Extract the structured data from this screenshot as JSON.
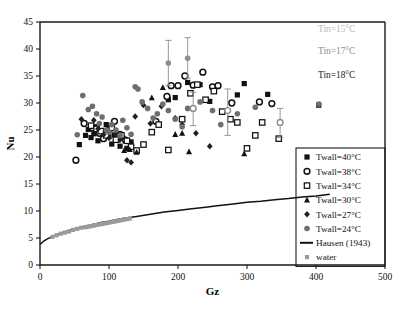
{
  "chart_data": {
    "type": "scatter",
    "title": "",
    "xlabel": "Gz",
    "ylabel": "Nu",
    "xlim": [
      0,
      500
    ],
    "ylim": [
      0,
      45
    ],
    "xticks": [
      0,
      100,
      200,
      300,
      400,
      500
    ],
    "yticks": [
      0,
      5,
      10,
      15,
      20,
      25,
      30,
      35,
      40,
      45
    ],
    "grid": false,
    "legend_position": "right-inside-box",
    "annotations": [
      {
        "name": "tin-15",
        "text": "Tin=15°C",
        "color": "#b9b9b9",
        "x": 430,
        "y": 43.2
      },
      {
        "name": "tin-17",
        "text": "Tin=17°C",
        "color": "#8d8d8d",
        "x": 430,
        "y": 39.0
      },
      {
        "name": "tin-18",
        "text": "Tin=18°C",
        "color": "#1a1a1a",
        "x": 430,
        "y": 34.6
      }
    ],
    "series": [
      {
        "name": "Twall=40°C",
        "label": "Twall=40°C",
        "marker": "filled-square",
        "color": "#111111",
        "points": [
          [
            57,
            22.3
          ],
          [
            66,
            24.0
          ],
          [
            70,
            25.1
          ],
          [
            74,
            23.6
          ],
          [
            78,
            24.3
          ],
          [
            80,
            25.6
          ],
          [
            84,
            23.0
          ],
          [
            88,
            24.6
          ],
          [
            96,
            26.0
          ],
          [
            100,
            23.8
          ],
          [
            104,
            22.4
          ],
          [
            108,
            24.1
          ],
          [
            112,
            23.2
          ],
          [
            116,
            22.0
          ],
          [
            120,
            23.5
          ],
          [
            126,
            21.6
          ],
          [
            132,
            22.8
          ],
          [
            186,
            30.6
          ],
          [
            196,
            31.0
          ],
          [
            214,
            33.8
          ],
          [
            232,
            33.4
          ],
          [
            246,
            30.3
          ],
          [
            286,
            31.5
          ],
          [
            296,
            33.6
          ],
          [
            330,
            31.6
          ],
          [
            404,
            29.6
          ]
        ]
      },
      {
        "name": "Twall=38°C",
        "label": "Twall=38°C",
        "marker": "open-circle-bold",
        "color": "#111111",
        "points": [
          [
            52,
            19.4
          ],
          [
            64,
            26.2
          ],
          [
            76,
            25.4
          ],
          [
            86,
            24.4
          ],
          [
            92,
            23.4
          ],
          [
            100,
            25.0
          ],
          [
            108,
            26.6
          ],
          [
            116,
            24.2
          ],
          [
            124,
            23.1
          ],
          [
            168,
            26.6
          ],
          [
            184,
            31.2
          ],
          [
            190,
            33.2
          ],
          [
            200,
            33.2
          ],
          [
            210,
            35.0
          ],
          [
            222,
            33.3
          ],
          [
            236,
            35.7
          ],
          [
            250,
            33.0
          ],
          [
            258,
            33.2
          ],
          [
            278,
            30.0
          ],
          [
            318,
            30.2
          ],
          [
            336,
            29.9
          ]
        ]
      },
      {
        "name": "Twall=34°C",
        "label": "Twall=34°C",
        "marker": "open-square",
        "color": "#111111",
        "points": [
          [
            74,
            25.8
          ],
          [
            82,
            25.2
          ],
          [
            88,
            24.8
          ],
          [
            96,
            24.0
          ],
          [
            104,
            25.4
          ],
          [
            110,
            23.2
          ],
          [
            118,
            24.0
          ],
          [
            126,
            23.0
          ],
          [
            132,
            21.9
          ],
          [
            140,
            21.2
          ],
          [
            150,
            22.3
          ],
          [
            162,
            24.6
          ],
          [
            172,
            26.0
          ],
          [
            186,
            21.3
          ],
          [
            206,
            27.0
          ],
          [
            218,
            31.8
          ],
          [
            228,
            33.4
          ],
          [
            240,
            30.6
          ],
          [
            252,
            32.2
          ],
          [
            264,
            28.4
          ],
          [
            276,
            27.0
          ],
          [
            286,
            26.4
          ],
          [
            300,
            21.6
          ],
          [
            312,
            24.0
          ],
          [
            322,
            26.4
          ],
          [
            346,
            23.4
          ]
        ]
      },
      {
        "name": "Twall=30°C",
        "label": "Twall=30°C",
        "marker": "filled-triangle",
        "color": "#111111",
        "points": [
          [
            122,
            21.2
          ],
          [
            130,
            21.4
          ],
          [
            140,
            20.9
          ],
          [
            162,
            31.0
          ],
          [
            178,
            32.9
          ],
          [
            196,
            24.2
          ],
          [
            206,
            24.4
          ],
          [
            216,
            21.0
          ],
          [
            296,
            20.6
          ]
        ]
      },
      {
        "name": "Twall=27°C",
        "label": "Twall=27°C",
        "marker": "filled-diamond",
        "color": "#222222",
        "points": [
          [
            60,
            27.0
          ],
          [
            78,
            26.8
          ],
          [
            84,
            25.2
          ],
          [
            92,
            24.1
          ],
          [
            100,
            23.5
          ],
          [
            110,
            24.2
          ],
          [
            116,
            23.2
          ],
          [
            126,
            19.4
          ],
          [
            132,
            19.0
          ],
          [
            138,
            27.5
          ],
          [
            150,
            29.6
          ],
          [
            160,
            26.2
          ],
          [
            176,
            29.4
          ],
          [
            196,
            27.2
          ],
          [
            206,
            26.0
          ],
          [
            226,
            24.4
          ],
          [
            246,
            22.0
          ]
        ]
      },
      {
        "name": "Twall=24°C",
        "label": "Twall=24°C",
        "marker": "filled-circle-gray",
        "color": "#6e6e6e",
        "points": [
          [
            54,
            24.1
          ],
          [
            62,
            31.4
          ],
          [
            70,
            28.8
          ],
          [
            76,
            29.4
          ],
          [
            82,
            28.0
          ],
          [
            86,
            26.2
          ],
          [
            90,
            27.4
          ],
          [
            96,
            25.0
          ],
          [
            100,
            24.6
          ],
          [
            104,
            26.0
          ],
          [
            110,
            25.0
          ],
          [
            116,
            24.0
          ],
          [
            120,
            26.8
          ],
          [
            126,
            25.4
          ],
          [
            132,
            24.2
          ],
          [
            138,
            33.0
          ],
          [
            142,
            32.6
          ],
          [
            148,
            30.2
          ],
          [
            156,
            29.0
          ],
          [
            164,
            27.2
          ],
          [
            170,
            28.0
          ],
          [
            178,
            29.8
          ],
          [
            186,
            28.6
          ],
          [
            196,
            27.0
          ],
          [
            206,
            25.6
          ],
          [
            214,
            29.0
          ],
          [
            232,
            30.2
          ],
          [
            250,
            28.6
          ],
          [
            262,
            26.0
          ],
          [
            286,
            28.0
          ],
          [
            312,
            29.2
          ],
          [
            404,
            29.8
          ]
        ]
      }
    ],
    "error_bar_points": [
      {
        "x": 186,
        "y": 37.4,
        "ylow": 33.2,
        "yhigh": 41.6,
        "marker": "filled-circle-gray"
      },
      {
        "x": 214,
        "y": 38.3,
        "ylow": 34.6,
        "yhigh": 42.1,
        "marker": "filled-circle-gray"
      },
      {
        "x": 222,
        "y": 29.0,
        "ylow": 25.8,
        "yhigh": 32.0,
        "marker": "open-circle-gray"
      },
      {
        "x": 272,
        "y": 28.6,
        "ylow": 24.0,
        "yhigh": 32.6,
        "marker": "open-circle-gray"
      },
      {
        "x": 348,
        "y": 26.4,
        "ylow": 23.6,
        "yhigh": 29.0,
        "marker": "open-circle-gray"
      }
    ],
    "curve": {
      "name": "Hausen (1943)",
      "label": "Hausen (1943)",
      "color": "#111111",
      "points": [
        [
          0,
          3.8
        ],
        [
          5,
          4.4
        ],
        [
          10,
          4.8
        ],
        [
          20,
          5.4
        ],
        [
          30,
          5.9
        ],
        [
          40,
          6.3
        ],
        [
          50,
          6.7
        ],
        [
          60,
          7.0
        ],
        [
          70,
          7.3
        ],
        [
          80,
          7.6
        ],
        [
          90,
          7.9
        ],
        [
          100,
          8.1
        ],
        [
          110,
          8.4
        ],
        [
          120,
          8.6
        ],
        [
          140,
          9.0
        ],
        [
          160,
          9.4
        ],
        [
          180,
          9.8
        ],
        [
          200,
          10.1
        ],
        [
          220,
          10.4
        ],
        [
          240,
          10.7
        ],
        [
          260,
          11.0
        ],
        [
          280,
          11.3
        ],
        [
          300,
          11.6
        ],
        [
          320,
          11.8
        ],
        [
          340,
          12.1
        ],
        [
          360,
          12.3
        ],
        [
          380,
          12.6
        ],
        [
          400,
          12.8
        ],
        [
          420,
          13.1
        ]
      ]
    },
    "water_series": {
      "name": "water",
      "label": "water",
      "marker": "small-square-gray",
      "color": "#9a9a9a",
      "points": [
        [
          18,
          5.2
        ],
        [
          24,
          5.5
        ],
        [
          30,
          5.8
        ],
        [
          36,
          6.0
        ],
        [
          42,
          6.2
        ],
        [
          48,
          6.5
        ],
        [
          54,
          6.7
        ],
        [
          60,
          6.9
        ],
        [
          66,
          7.0
        ],
        [
          70,
          7.1
        ],
        [
          74,
          7.2
        ],
        [
          78,
          7.3
        ],
        [
          82,
          7.4
        ],
        [
          86,
          7.5
        ],
        [
          90,
          7.6
        ],
        [
          94,
          7.7
        ],
        [
          98,
          7.8
        ],
        [
          102,
          7.9
        ],
        [
          106,
          8.0
        ],
        [
          110,
          8.1
        ],
        [
          114,
          8.2
        ],
        [
          118,
          8.3
        ],
        [
          122,
          8.4
        ],
        [
          126,
          8.5
        ],
        [
          130,
          8.6
        ]
      ]
    }
  }
}
